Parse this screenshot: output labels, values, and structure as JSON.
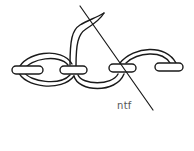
{
  "diagram": {
    "type": "stitch illustration",
    "label": "ntf",
    "colors": {
      "stroke": "#1a1a1a",
      "label": "#555555",
      "background": "#ffffff"
    }
  }
}
